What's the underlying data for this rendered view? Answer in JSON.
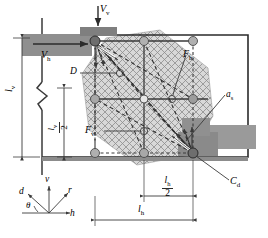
{
  "figure": {
    "type": "engineering-diagram"
  },
  "colors": {
    "plate_dark": "#8c8c8c",
    "plate_mid": "#9a9a9a",
    "hatch_fill": "#cfcfcf",
    "node_dark": "#6e6e6e",
    "node_light": "#b0b0b0",
    "line": "#2b2b2b",
    "thin": "#4a4a4a",
    "white": "#ffffff"
  },
  "labels": {
    "vertical_shear": "V",
    "vertical_shear_sub": "v",
    "horizontal_shear": "V",
    "horizontal_shear_sub": "h",
    "diameter": "D",
    "force_h": "F",
    "force_h_sub": "h",
    "force_v": "F",
    "force_v_sub": "v",
    "anchor_spacing": "a",
    "anchor_spacing_sub": "s",
    "centroid": "C",
    "centroid_sub": "d",
    "len_v": "l",
    "len_v_sub": "v",
    "len_v_half_num": "l",
    "len_v_half_sub": "v",
    "len_v_half_den": "2",
    "len_h": "l",
    "len_h_sub": "h",
    "len_h_half_num": "l",
    "len_h_half_sub": "h",
    "len_h_half_den": "2"
  },
  "axes": {
    "d_label": "d",
    "v_label": "v",
    "r_label": "r",
    "h_label": "h",
    "theta_label": "θ"
  },
  "geometry": {
    "frame": {
      "x": 42,
      "y": 35,
      "w": 206,
      "h": 122
    },
    "nodes": [
      {
        "id": "n-tl",
        "x": 95,
        "y": 41,
        "r": 5.0,
        "kind": "dark"
      },
      {
        "id": "n-tc",
        "x": 144,
        "y": 41,
        "r": 4.5,
        "kind": "light"
      },
      {
        "id": "n-tr",
        "x": 193,
        "y": 41,
        "r": 4.5,
        "kind": "light"
      },
      {
        "id": "n-ml",
        "x": 95,
        "y": 99,
        "r": 4.5,
        "kind": "light"
      },
      {
        "id": "n-mc",
        "x": 144,
        "y": 99,
        "r": 4.0,
        "kind": "open"
      },
      {
        "id": "n-mr",
        "x": 193,
        "y": 99,
        "r": 4.5,
        "kind": "light"
      },
      {
        "id": "n-bl",
        "x": 95,
        "y": 153,
        "r": 4.5,
        "kind": "light"
      },
      {
        "id": "n-bc",
        "x": 144,
        "y": 153,
        "r": 4.5,
        "kind": "light"
      },
      {
        "id": "n-br",
        "x": 193,
        "y": 153,
        "r": 5.0,
        "kind": "dark"
      }
    ]
  }
}
